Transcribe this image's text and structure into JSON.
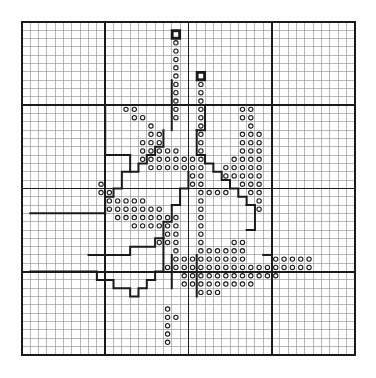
{
  "document": {
    "title": "Needlework Pattern Chart",
    "type": "counted-thread-grid-chart",
    "background_color": "#ffffff",
    "ink_color": "#1a1a1a"
  },
  "chart_data": {
    "type": "heatmap",
    "xlabel": "",
    "ylabel": "",
    "grid": true,
    "legend_position": "none",
    "columns": 40,
    "rows": 40,
    "cell_size_px": 8.32,
    "origin_px": [
      22,
      22
    ],
    "gridlines": {
      "minor_every": 1,
      "major_every": 10,
      "minor_color": "#8a8a8a",
      "minor_width": 0.6,
      "major_color": "#1a1a1a",
      "major_width": 1.8,
      "border_color": "#1a1a1a",
      "border_width": 2.2
    },
    "symbols": {
      "circle": {
        "name": "circle-symbol",
        "stroke": "#1a1a1a",
        "fill": "none",
        "radius_ratio": 0.26,
        "description": "small open circle stitch marker"
      },
      "box": {
        "name": "box-symbol",
        "stroke": "#1a1a1a",
        "fill": "none",
        "description": "heavy open square marker"
      }
    },
    "categories": [
      "c0",
      "c1",
      "c2",
      "c3",
      "c4",
      "c5",
      "c6",
      "c7",
      "c8",
      "c9",
      "c10",
      "c11",
      "c12",
      "c13",
      "c14",
      "c15",
      "c16",
      "c17",
      "c18",
      "c19",
      "c20",
      "c21",
      "c22",
      "c23",
      "c24",
      "c25",
      "c26",
      "c27",
      "c28",
      "c29",
      "c30",
      "c31",
      "c32",
      "c33",
      "c34",
      "c35",
      "c36",
      "c37",
      "c38",
      "c39"
    ],
    "row_labels": [
      "r0",
      "r1",
      "r2",
      "r3",
      "r4",
      "r5",
      "r6",
      "r7",
      "r8",
      "r9",
      "r10",
      "r11",
      "r12",
      "r13",
      "r14",
      "r15",
      "r16",
      "r17",
      "r18",
      "r19",
      "r20",
      "r21",
      "r22",
      "r23",
      "r24",
      "r25",
      "r26",
      "r27",
      "r28",
      "r29",
      "r30",
      "r31",
      "r32",
      "r33",
      "r34",
      "r35",
      "r36",
      "r37",
      "r38",
      "r39"
    ],
    "box_cells": [
      [
        18,
        1
      ],
      [
        21,
        6
      ]
    ],
    "circle_cells": [
      [
        18,
        2
      ],
      [
        18,
        3
      ],
      [
        18,
        4
      ],
      [
        18,
        5
      ],
      [
        18,
        6
      ],
      [
        18,
        7
      ],
      [
        18,
        8
      ],
      [
        18,
        9
      ],
      [
        21,
        7
      ],
      [
        21,
        8
      ],
      [
        21,
        9
      ],
      [
        12,
        10
      ],
      [
        13,
        10
      ],
      [
        18,
        10
      ],
      [
        21,
        10
      ],
      [
        26,
        10
      ],
      [
        27,
        10
      ],
      [
        13,
        11
      ],
      [
        14,
        11
      ],
      [
        18,
        11
      ],
      [
        21,
        11
      ],
      [
        26,
        11
      ],
      [
        27,
        11
      ],
      [
        15,
        12
      ],
      [
        21,
        12
      ],
      [
        27,
        12
      ],
      [
        15,
        13
      ],
      [
        16,
        13
      ],
      [
        21,
        13
      ],
      [
        26,
        13
      ],
      [
        27,
        13
      ],
      [
        28,
        13
      ],
      [
        14,
        14
      ],
      [
        15,
        14
      ],
      [
        16,
        14
      ],
      [
        21,
        14
      ],
      [
        26,
        14
      ],
      [
        27,
        14
      ],
      [
        28,
        14
      ],
      [
        14,
        15
      ],
      [
        15,
        15
      ],
      [
        16,
        15
      ],
      [
        17,
        15
      ],
      [
        18,
        15
      ],
      [
        21,
        15
      ],
      [
        26,
        15
      ],
      [
        27,
        15
      ],
      [
        28,
        15
      ],
      [
        14,
        16
      ],
      [
        15,
        16
      ],
      [
        16,
        16
      ],
      [
        17,
        16
      ],
      [
        18,
        16
      ],
      [
        19,
        16
      ],
      [
        20,
        16
      ],
      [
        21,
        16
      ],
      [
        25,
        16
      ],
      [
        26,
        16
      ],
      [
        27,
        16
      ],
      [
        28,
        16
      ],
      [
        15,
        17
      ],
      [
        16,
        17
      ],
      [
        17,
        17
      ],
      [
        18,
        17
      ],
      [
        19,
        17
      ],
      [
        20,
        17
      ],
      [
        21,
        17
      ],
      [
        24,
        17
      ],
      [
        25,
        17
      ],
      [
        26,
        17
      ],
      [
        27,
        17
      ],
      [
        28,
        17
      ],
      [
        20,
        18
      ],
      [
        21,
        18
      ],
      [
        24,
        18
      ],
      [
        25,
        18
      ],
      [
        26,
        18
      ],
      [
        27,
        18
      ],
      [
        28,
        18
      ],
      [
        9,
        19
      ],
      [
        20,
        19
      ],
      [
        21,
        19
      ],
      [
        26,
        19
      ],
      [
        27,
        19
      ],
      [
        28,
        19
      ],
      [
        9,
        20
      ],
      [
        10,
        20
      ],
      [
        21,
        20
      ],
      [
        22,
        20
      ],
      [
        23,
        20
      ],
      [
        24,
        20
      ],
      [
        27,
        20
      ],
      [
        28,
        20
      ],
      [
        10,
        21
      ],
      [
        11,
        21
      ],
      [
        12,
        21
      ],
      [
        13,
        21
      ],
      [
        14,
        21
      ],
      [
        21,
        21
      ],
      [
        28,
        21
      ],
      [
        10,
        22
      ],
      [
        11,
        22
      ],
      [
        12,
        22
      ],
      [
        13,
        22
      ],
      [
        14,
        22
      ],
      [
        15,
        22
      ],
      [
        16,
        22
      ],
      [
        21,
        22
      ],
      [
        28,
        22
      ],
      [
        11,
        23
      ],
      [
        12,
        23
      ],
      [
        13,
        23
      ],
      [
        14,
        23
      ],
      [
        15,
        23
      ],
      [
        16,
        23
      ],
      [
        17,
        23
      ],
      [
        18,
        23
      ],
      [
        21,
        23
      ],
      [
        13,
        24
      ],
      [
        14,
        24
      ],
      [
        15,
        24
      ],
      [
        16,
        24
      ],
      [
        17,
        24
      ],
      [
        18,
        24
      ],
      [
        21,
        24
      ],
      [
        17,
        25
      ],
      [
        18,
        25
      ],
      [
        21,
        25
      ],
      [
        16,
        26
      ],
      [
        17,
        26
      ],
      [
        18,
        26
      ],
      [
        21,
        26
      ],
      [
        25,
        26
      ],
      [
        26,
        26
      ],
      [
        18,
        27
      ],
      [
        21,
        27
      ],
      [
        22,
        27
      ],
      [
        23,
        27
      ],
      [
        24,
        27
      ],
      [
        25,
        27
      ],
      [
        26,
        27
      ],
      [
        18,
        28
      ],
      [
        19,
        28
      ],
      [
        20,
        28
      ],
      [
        21,
        28
      ],
      [
        22,
        28
      ],
      [
        23,
        28
      ],
      [
        24,
        28
      ],
      [
        25,
        28
      ],
      [
        26,
        28
      ],
      [
        30,
        28
      ],
      [
        31,
        28
      ],
      [
        32,
        28
      ],
      [
        33,
        28
      ],
      [
        34,
        28
      ],
      [
        17,
        29
      ],
      [
        18,
        29
      ],
      [
        19,
        29
      ],
      [
        20,
        29
      ],
      [
        21,
        29
      ],
      [
        22,
        29
      ],
      [
        23,
        29
      ],
      [
        24,
        29
      ],
      [
        25,
        29
      ],
      [
        26,
        29
      ],
      [
        27,
        29
      ],
      [
        28,
        29
      ],
      [
        29,
        29
      ],
      [
        30,
        29
      ],
      [
        31,
        29
      ],
      [
        32,
        29
      ],
      [
        33,
        29
      ],
      [
        34,
        29
      ],
      [
        19,
        30
      ],
      [
        20,
        30
      ],
      [
        21,
        30
      ],
      [
        22,
        30
      ],
      [
        23,
        30
      ],
      [
        24,
        30
      ],
      [
        25,
        30
      ],
      [
        26,
        30
      ],
      [
        27,
        30
      ],
      [
        28,
        30
      ],
      [
        29,
        30
      ],
      [
        30,
        30
      ],
      [
        19,
        31
      ],
      [
        20,
        31
      ],
      [
        21,
        31
      ],
      [
        22,
        31
      ],
      [
        23,
        31
      ],
      [
        24,
        31
      ],
      [
        25,
        31
      ],
      [
        26,
        31
      ],
      [
        27,
        31
      ],
      [
        21,
        32
      ],
      [
        22,
        32
      ],
      [
        23,
        32
      ],
      [
        17,
        34
      ],
      [
        17,
        35
      ],
      [
        18,
        35
      ],
      [
        17,
        36
      ],
      [
        17,
        37
      ],
      [
        17,
        38
      ]
    ],
    "heavy_outline_paths": [
      [
        [
          18,
          1
        ],
        [
          19,
          1
        ],
        [
          19,
          2
        ],
        [
          18,
          2
        ],
        [
          18,
          1
        ]
      ],
      [
        [
          21,
          6
        ],
        [
          22,
          6
        ],
        [
          22,
          7
        ],
        [
          21,
          7
        ],
        [
          21,
          6
        ]
      ],
      [
        [
          18,
          7
        ],
        [
          18,
          13
        ]
      ],
      [
        [
          10,
          10
        ],
        [
          10,
          16
        ],
        [
          13,
          16
        ]
      ],
      [
        [
          13,
          16
        ],
        [
          13,
          18
        ],
        [
          12,
          18
        ],
        [
          12,
          20
        ],
        [
          11,
          20
        ],
        [
          11,
          21
        ],
        [
          10,
          21
        ],
        [
          10,
          23
        ],
        [
          1,
          23
        ]
      ],
      [
        [
          17,
          13
        ],
        [
          17,
          15
        ],
        [
          16,
          15
        ],
        [
          16,
          16
        ],
        [
          15,
          16
        ],
        [
          15,
          17
        ],
        [
          14,
          17
        ],
        [
          14,
          18
        ],
        [
          13,
          18
        ]
      ],
      [
        [
          22,
          10
        ],
        [
          22,
          13
        ],
        [
          21,
          13
        ]
      ],
      [
        [
          21,
          13
        ],
        [
          21,
          16
        ],
        [
          22,
          16
        ],
        [
          22,
          17
        ],
        [
          23,
          17
        ],
        [
          23,
          18
        ],
        [
          24,
          18
        ],
        [
          24,
          19
        ],
        [
          25,
          19
        ],
        [
          25,
          20
        ],
        [
          26,
          20
        ],
        [
          26,
          21
        ],
        [
          27,
          21
        ],
        [
          27,
          22
        ]
      ],
      [
        [
          20,
          18
        ],
        [
          20,
          20
        ],
        [
          19,
          20
        ],
        [
          19,
          22
        ],
        [
          18,
          22
        ],
        [
          18,
          24
        ],
        [
          17,
          24
        ],
        [
          17,
          26
        ],
        [
          16,
          26
        ],
        [
          16,
          27
        ],
        [
          13,
          27
        ],
        [
          13,
          28
        ],
        [
          8,
          28
        ]
      ],
      [
        [
          27,
          22
        ],
        [
          28,
          22
        ],
        [
          28,
          25
        ],
        [
          27,
          25
        ]
      ],
      [
        [
          17,
          26
        ],
        [
          17,
          30
        ],
        [
          16,
          30
        ],
        [
          16,
          31
        ],
        [
          15,
          31
        ],
        [
          15,
          32
        ],
        [
          14,
          32
        ],
        [
          14,
          33
        ],
        [
          13,
          33
        ],
        [
          13,
          32
        ],
        [
          11,
          32
        ],
        [
          11,
          31
        ],
        [
          9,
          31
        ],
        [
          9,
          30
        ],
        [
          1,
          30
        ]
      ],
      [
        [
          18,
          28
        ],
        [
          18,
          32
        ]
      ],
      [
        [
          21,
          28
        ],
        [
          21,
          33
        ]
      ],
      [
        [
          29,
          28
        ],
        [
          30,
          28
        ]
      ]
    ],
    "stepped_border_segments": [
      {
        "name": "upper-left-step",
        "cells": [
          [
            10,
            10
          ],
          [
            13,
            16
          ],
          [
            10,
            23
          ]
        ]
      },
      {
        "name": "upper-right-step",
        "cells": [
          [
            22,
            10
          ],
          [
            27,
            22
          ]
        ]
      },
      {
        "name": "lower-left-step",
        "cells": [
          [
            17,
            26
          ],
          [
            13,
            33
          ],
          [
            9,
            31
          ]
        ]
      },
      {
        "name": "lower-right-step",
        "cells": [
          [
            28,
            22
          ],
          [
            34,
            28
          ]
        ]
      }
    ]
  }
}
